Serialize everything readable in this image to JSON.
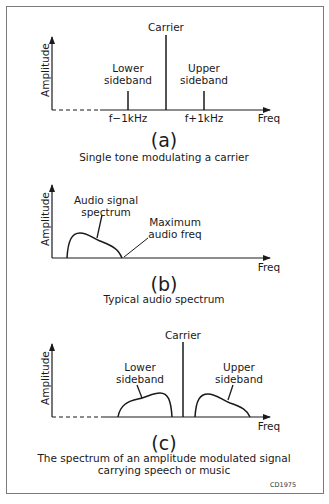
{
  "figure_code": "CD1975",
  "panels": {
    "a": {
      "id": "(a)",
      "caption": "Single tone modulating a carrier",
      "ylabel": "Amplitude",
      "xlabel": "Freq",
      "carrier_label": "Carrier",
      "lower_label_1": "Lower",
      "lower_label_2": "sideband",
      "upper_label_1": "Upper",
      "upper_label_2": "sideband",
      "lower_tick": "f−1kHz",
      "upper_tick": "f+1kHz"
    },
    "b": {
      "id": "(b)",
      "caption": "Typical audio spectrum",
      "ylabel": "Amplitude",
      "xlabel": "Freq",
      "spectrum_label_1": "Audio signal",
      "spectrum_label_2": "spectrum",
      "max_label_1": "Maximum",
      "max_label_2": "audio freq"
    },
    "c": {
      "id": "(c)",
      "caption_1": "The spectrum of an amplitude modulated signal",
      "caption_2": "carrying speech or music",
      "ylabel": "Amplitude",
      "xlabel": "Freq",
      "carrier_label": "Carrier",
      "lower_label_1": "Lower",
      "lower_label_2": "sideband",
      "upper_label_1": "Upper",
      "upper_label_2": "sideband"
    }
  },
  "colors": {
    "line": "#1a1a1a",
    "border": "#7a7a7a",
    "background": "#ffffff"
  }
}
